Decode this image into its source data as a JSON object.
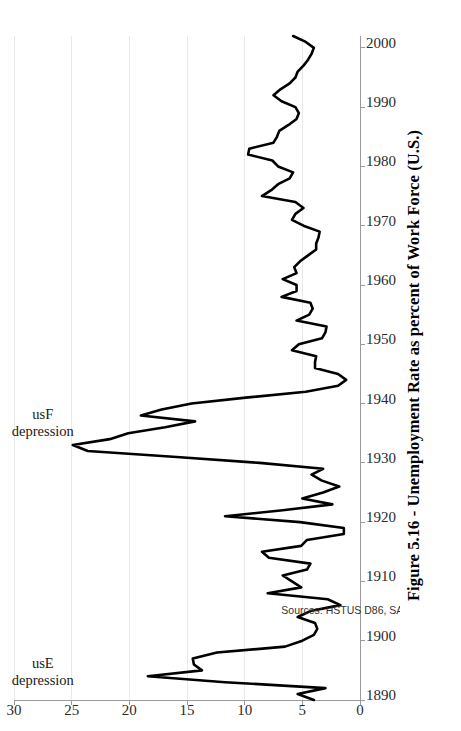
{
  "figure": {
    "caption": "Figure 5.16 - Unemployment Rate as percent of Work Force (U.S.)",
    "source_note": "Sources: HSTUS D86, SAUS",
    "orientation": "rotated-90-ccw",
    "background_color": "#ffffff",
    "line_color": "#000000",
    "grid_color": "#e9e9e9",
    "axis_color": "#9a9a9a"
  },
  "annotations": [
    {
      "id": "use-depression",
      "line1": "usE",
      "line2": "depression",
      "at_year": 1894,
      "at_value": 27.5
    },
    {
      "id": "usf-depression",
      "line1": "usF",
      "line2": "depression",
      "at_year": 1936,
      "at_value": 27.5
    }
  ],
  "chart_data": {
    "type": "line",
    "title": "Figure 5.16 - Unemployment Rate as percent of Work Force (U.S.)",
    "subtitle": "",
    "xlabel": "",
    "ylabel": "",
    "xlim": [
      1890,
      2002
    ],
    "ylim": [
      0,
      30
    ],
    "xticks": [
      1890,
      1900,
      1910,
      1920,
      1930,
      1940,
      1950,
      1960,
      1970,
      1980,
      1990,
      2000
    ],
    "yticks": [
      0,
      5,
      10,
      15,
      20,
      25,
      30
    ],
    "grid": "y-gridlines-only",
    "legend": "none",
    "series": [
      {
        "name": "Unemployment rate (percent of work force)",
        "x": [
          1890,
          1891,
          1892,
          1893,
          1894,
          1895,
          1896,
          1897,
          1898,
          1899,
          1900,
          1901,
          1902,
          1903,
          1904,
          1905,
          1906,
          1907,
          1908,
          1909,
          1910,
          1911,
          1912,
          1913,
          1914,
          1915,
          1916,
          1917,
          1918,
          1919,
          1920,
          1921,
          1922,
          1923,
          1924,
          1925,
          1926,
          1927,
          1928,
          1929,
          1930,
          1931,
          1932,
          1933,
          1934,
          1935,
          1936,
          1937,
          1938,
          1939,
          1940,
          1941,
          1942,
          1943,
          1944,
          1945,
          1946,
          1947,
          1948,
          1949,
          1950,
          1951,
          1952,
          1953,
          1954,
          1955,
          1956,
          1957,
          1958,
          1959,
          1960,
          1961,
          1962,
          1963,
          1964,
          1965,
          1966,
          1967,
          1968,
          1969,
          1970,
          1971,
          1972,
          1973,
          1974,
          1975,
          1976,
          1977,
          1978,
          1979,
          1980,
          1981,
          1982,
          1983,
          1984,
          1985,
          1986,
          1987,
          1988,
          1989,
          1990,
          1991,
          1992,
          1993,
          1994,
          1995,
          1996,
          1997,
          1998,
          1999,
          2000,
          2001,
          2002
        ],
        "values": [
          4.0,
          5.4,
          3.0,
          11.7,
          18.4,
          13.7,
          14.4,
          14.5,
          12.4,
          6.5,
          5.0,
          4.0,
          3.7,
          3.9,
          5.4,
          4.3,
          1.7,
          2.8,
          8.0,
          5.1,
          5.9,
          6.7,
          4.6,
          4.3,
          7.9,
          8.5,
          5.1,
          4.6,
          1.4,
          1.4,
          5.2,
          11.7,
          6.7,
          2.4,
          5.0,
          3.2,
          1.8,
          3.3,
          4.2,
          3.2,
          8.7,
          15.9,
          23.6,
          24.9,
          21.7,
          20.1,
          16.9,
          14.3,
          19.0,
          17.2,
          14.6,
          9.9,
          4.7,
          1.9,
          1.2,
          1.9,
          3.9,
          3.9,
          3.8,
          5.9,
          5.3,
          3.3,
          3.0,
          2.9,
          5.5,
          4.4,
          4.1,
          4.3,
          6.8,
          5.5,
          5.5,
          6.7,
          5.5,
          5.7,
          5.2,
          4.5,
          3.8,
          3.8,
          3.6,
          3.5,
          4.9,
          5.9,
          5.6,
          4.9,
          5.6,
          8.5,
          7.7,
          7.1,
          6.1,
          5.8,
          7.1,
          7.6,
          9.7,
          9.6,
          7.5,
          7.2,
          7.0,
          6.2,
          5.5,
          5.3,
          5.6,
          6.8,
          7.5,
          6.9,
          6.1,
          5.6,
          5.4,
          4.9,
          4.5,
          4.2,
          4.0,
          4.7,
          5.8
        ]
      }
    ],
    "notable_points": [
      {
        "year": 1894,
        "value": 18.4,
        "note": "usE depression peak"
      },
      {
        "year": 1933,
        "value": 24.9,
        "note": "usF depression peak"
      },
      {
        "year": 1944,
        "value": 1.2,
        "note": "wartime low"
      },
      {
        "year": 1982,
        "value": 9.7,
        "note": "postwar peak"
      }
    ]
  }
}
